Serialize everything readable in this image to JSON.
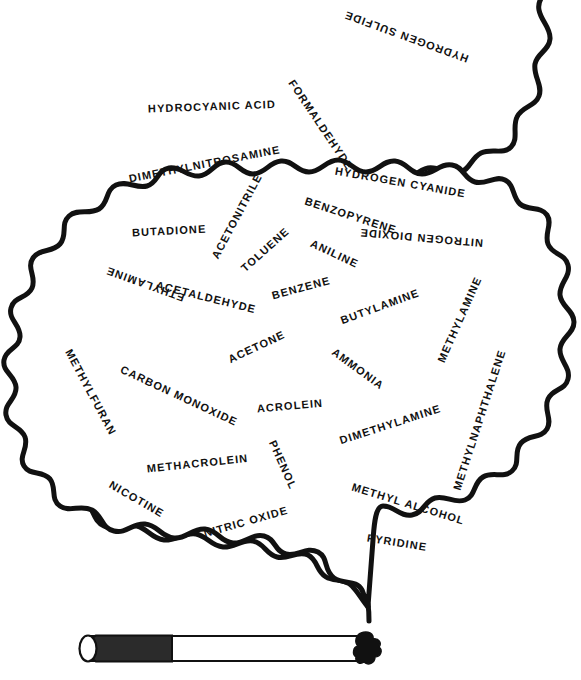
{
  "figure": {
    "background_color": "#ffffff",
    "ink_color": "#111111"
  },
  "smoke_cloud": {
    "name": "smoke-cloud",
    "outline_color": "#111111",
    "outline_width": 5,
    "fill_color": "#ffffff"
  },
  "smoke_stem": {
    "name": "smoke-stem",
    "color": "#111111"
  },
  "cigarette": {
    "name": "cigarette",
    "filter_color": "#2b2b2b",
    "paper_color": "#ffffff",
    "outline_color": "#111111",
    "ember_color": "#111111"
  },
  "chemicals": [
    {
      "label": "HYDROCYANIC ACID",
      "x": 148,
      "y": 109,
      "rot": -2,
      "size": 11
    },
    {
      "label": "FORMALDEHYDE",
      "x": 291,
      "y": 81,
      "rot": 56,
      "size": 11
    },
    {
      "label": "HYDROGEN SULFIDE",
      "x": 468,
      "y": 59,
      "rot": 200,
      "size": 11
    },
    {
      "label": "DIMETHYLNITROSAMINE",
      "x": 129,
      "y": 179,
      "rot": -11,
      "size": 11
    },
    {
      "label": "HYDROGEN CYANIDE",
      "x": 335,
      "y": 171,
      "rot": 10,
      "size": 11
    },
    {
      "label": "BUTADIONE",
      "x": 132,
      "y": 233,
      "rot": -3,
      "size": 11
    },
    {
      "label": "ACETONITRILE",
      "x": 215,
      "y": 258,
      "rot": -62,
      "size": 11
    },
    {
      "label": "BENZOPYRENE",
      "x": 305,
      "y": 201,
      "rot": 18,
      "size": 11
    },
    {
      "label": "TOLUENE",
      "x": 243,
      "y": 270,
      "rot": -42,
      "size": 11
    },
    {
      "label": "ANILINE",
      "x": 311,
      "y": 243,
      "rot": 25,
      "size": 11
    },
    {
      "label": "NITROGEN DIOXIDE",
      "x": 483,
      "y": 243,
      "rot": 185,
      "size": 11
    },
    {
      "label": "ACETALDEHYDE",
      "x": 156,
      "y": 285,
      "rot": 14,
      "size": 11
    },
    {
      "label": "BENZENE",
      "x": 272,
      "y": 296,
      "rot": -15,
      "size": 11
    },
    {
      "label": "ETHYLAMINE",
      "x": 184,
      "y": 298,
      "rot": 200,
      "size": 11
    },
    {
      "label": "BUTYLAMINE",
      "x": 341,
      "y": 321,
      "rot": -20,
      "size": 11
    },
    {
      "label": "METHYLAMINE",
      "x": 441,
      "y": 362,
      "rot": -66,
      "size": 11
    },
    {
      "label": "METHYLFURAN",
      "x": 68,
      "y": 350,
      "rot": 62,
      "size": 11
    },
    {
      "label": "CARBON MONOXIDE",
      "x": 121,
      "y": 369,
      "rot": 25,
      "size": 11
    },
    {
      "label": "ACETONE",
      "x": 229,
      "y": 360,
      "rot": -25,
      "size": 11
    },
    {
      "label": "AMMONIA",
      "x": 333,
      "y": 351,
      "rot": 36,
      "size": 11
    },
    {
      "label": "ACROLEIN",
      "x": 257,
      "y": 409,
      "rot": -5,
      "size": 11
    },
    {
      "label": "DIMETHYLAMINE",
      "x": 340,
      "y": 441,
      "rot": -18,
      "size": 11
    },
    {
      "label": "METHYLNAPHTHALENE",
      "x": 457,
      "y": 490,
      "rot": -72,
      "size": 11
    },
    {
      "label": "PHENOL",
      "x": 272,
      "y": 441,
      "rot": 66,
      "size": 11
    },
    {
      "label": "METHACROLEIN",
      "x": 147,
      "y": 469,
      "rot": -6,
      "size": 11
    },
    {
      "label": "NICOTINE",
      "x": 110,
      "y": 484,
      "rot": 30,
      "size": 11
    },
    {
      "label": "METHYL ALCOHOL",
      "x": 352,
      "y": 487,
      "rot": 17,
      "size": 11
    },
    {
      "label": "NITRIC OXIDE",
      "x": 204,
      "y": 534,
      "rot": -16,
      "size": 11
    },
    {
      "label": "PYRIDINE",
      "x": 367,
      "y": 538,
      "rot": 9,
      "size": 11
    }
  ]
}
